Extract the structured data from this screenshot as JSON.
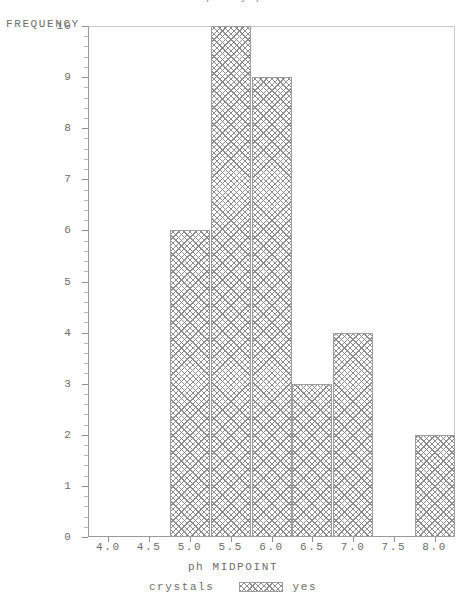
{
  "chart_data": {
    "type": "bar",
    "title": "Frequency plot",
    "xlabel": "ph MIDPOINT",
    "ylabel": "FREQUENCY",
    "categories": [
      "4.0",
      "4.5",
      "5.0",
      "5.5",
      "6.0",
      "6.5",
      "7.0",
      "7.5",
      "8.0"
    ],
    "values": [
      0,
      0,
      6,
      10,
      9,
      3,
      4,
      0,
      2
    ],
    "x": [
      4.0,
      4.5,
      5.0,
      5.5,
      6.0,
      6.5,
      7.0,
      7.5,
      8.0
    ],
    "xlim": [
      3.75,
      8.25
    ],
    "ylim": [
      0,
      10
    ],
    "x_tick_labels": [
      "4.0",
      "4.5",
      "5.0",
      "5.5",
      "6.0",
      "6.5",
      "7.0",
      "7.5",
      "8.0"
    ],
    "y_tick_labels": [
      "0",
      "1",
      "2",
      "3",
      "4",
      "5",
      "6",
      "7",
      "8",
      "9",
      "10"
    ],
    "y_tick_values": [
      0,
      1,
      2,
      3,
      4,
      5,
      6,
      7,
      8,
      9,
      10
    ],
    "y_minor_ticks_per_major": 5,
    "grid": false,
    "legend_position": "bottom",
    "series": [
      {
        "name": "yes",
        "values": [
          0,
          0,
          6,
          10,
          9,
          3,
          4,
          0,
          2
        ],
        "fill": "crosshatch",
        "color": "#8d8d8d"
      }
    ],
    "legend": {
      "title": "crystals",
      "entries": [
        {
          "label": "yes",
          "swatch": "crosshatch-swatch"
        }
      ]
    },
    "colors": {
      "axis": "#9a9a9a",
      "frame": "#c8c8c8",
      "text": "#6e6e6e",
      "hatch": "#8d8d8d",
      "background": "#ffffff"
    }
  }
}
